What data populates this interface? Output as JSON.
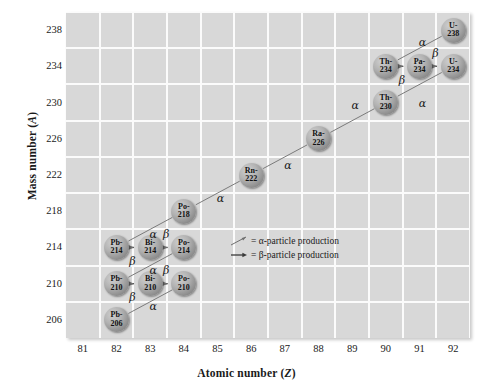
{
  "chart_data": {
    "type": "scatter",
    "title": "",
    "xlabel": "Atomic number (Z)",
    "ylabel": "Mass number (A)",
    "xlabel_symbol": "Z",
    "ylabel_symbol": "A",
    "xlabel_prefix": "Atomic number (",
    "ylabel_prefix": "Mass number (",
    "label_suffix": ")",
    "xlim": [
      80.5,
      92.5
    ],
    "ylim": [
      204,
      240
    ],
    "xticks": [
      81,
      82,
      83,
      84,
      85,
      86,
      87,
      88,
      89,
      90,
      91,
      92
    ],
    "yticks": [
      206,
      210,
      214,
      218,
      222,
      226,
      230,
      234,
      238
    ],
    "grid": true,
    "legend_position": "center",
    "nodes": [
      {
        "element": "U-",
        "mass": "238",
        "z": 92,
        "a": 238
      },
      {
        "element": "Th-",
        "mass": "234",
        "z": 90,
        "a": 234
      },
      {
        "element": "Pa-",
        "mass": "234",
        "z": 91,
        "a": 234
      },
      {
        "element": "U-",
        "mass": "234",
        "z": 92,
        "a": 234
      },
      {
        "element": "Th-",
        "mass": "230",
        "z": 90,
        "a": 230
      },
      {
        "element": "Ra-",
        "mass": "226",
        "z": 88,
        "a": 226
      },
      {
        "element": "Rn-",
        "mass": "222",
        "z": 86,
        "a": 222
      },
      {
        "element": "Po-",
        "mass": "218",
        "z": 84,
        "a": 218
      },
      {
        "element": "Pb-",
        "mass": "214",
        "z": 82,
        "a": 214
      },
      {
        "element": "Bi-",
        "mass": "214",
        "z": 83,
        "a": 214
      },
      {
        "element": "Po-",
        "mass": "214",
        "z": 84,
        "a": 214
      },
      {
        "element": "Pb-",
        "mass": "210",
        "z": 82,
        "a": 210
      },
      {
        "element": "Bi-",
        "mass": "210",
        "z": 83,
        "a": 210
      },
      {
        "element": "Po-",
        "mass": "210",
        "z": 84,
        "a": 210
      },
      {
        "element": "Pb-",
        "mass": "206",
        "z": 82,
        "a": 206
      }
    ],
    "decays": [
      {
        "from": "U-238",
        "to": "Th-234",
        "type": "alpha",
        "label": "α",
        "lx": 91.1,
        "ly": 236.6
      },
      {
        "from": "Th-234",
        "to": "Pa-234",
        "type": "beta",
        "label": "β",
        "lx": 90.5,
        "ly": 232.4
      },
      {
        "from": "Pa-234",
        "to": "U-234",
        "type": "beta",
        "label": "β",
        "lx": 91.5,
        "ly": 235.4
      },
      {
        "from": "U-234",
        "to": "Th-230",
        "type": "alpha",
        "label": "α",
        "lx": 91.1,
        "ly": 229.8
      },
      {
        "from": "Th-230",
        "to": "Ra-226",
        "type": "alpha",
        "label": "α",
        "lx": 89.1,
        "ly": 229.6
      },
      {
        "from": "Ra-226",
        "to": "Rn-222",
        "type": "alpha",
        "label": "α",
        "lx": 87.1,
        "ly": 223.0
      },
      {
        "from": "Rn-222",
        "to": "Po-218",
        "type": "alpha",
        "label": "α",
        "lx": 85.1,
        "ly": 219.4
      },
      {
        "from": "Po-218",
        "to": "Pb-214",
        "type": "alpha",
        "label": "α",
        "lx": 83.1,
        "ly": 215.4
      },
      {
        "from": "Pb-214",
        "to": "Bi-214",
        "type": "beta",
        "label": "β",
        "lx": 82.5,
        "ly": 212.4
      },
      {
        "from": "Bi-214",
        "to": "Po-214",
        "type": "beta",
        "label": "β",
        "lx": 83.5,
        "ly": 215.4
      },
      {
        "from": "Po-214",
        "to": "Pb-210",
        "type": "alpha",
        "label": "α",
        "lx": 83.1,
        "ly": 211.4
      },
      {
        "from": "Pb-210",
        "to": "Bi-210",
        "type": "beta",
        "label": "β",
        "lx": 82.5,
        "ly": 208.4
      },
      {
        "from": "Bi-210",
        "to": "Po-210",
        "type": "beta",
        "label": "β",
        "lx": 83.5,
        "ly": 211.4
      },
      {
        "from": "Po-210",
        "to": "Pb-206",
        "type": "alpha",
        "label": "α",
        "lx": 83.1,
        "ly": 207.4
      }
    ],
    "colors": {
      "plot_background": "#d8d8d8",
      "gridline": "#fbfbfb",
      "node_fill": "#a0a0a0",
      "arrow": "#6e6e6e",
      "text": "#1a1a1a"
    }
  },
  "legend": {
    "alpha_text": "= α-particle production",
    "beta_text": "= β-particle production",
    "alpha_glyph": "diagonal-arrow",
    "beta_glyph": "horizontal-arrow"
  }
}
